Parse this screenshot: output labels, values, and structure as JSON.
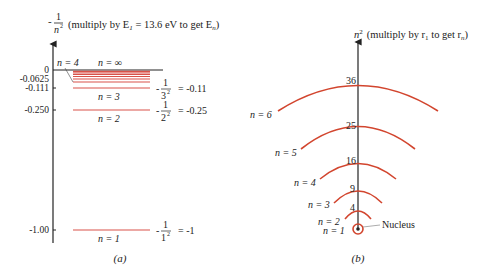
{
  "panel_a": {
    "caption": "(a)",
    "axis_label_prefix": "-",
    "axis_label_num": "1",
    "axis_label_den": "n",
    "axis_label_den_exp": "2",
    "axis_note": "(multiply by E",
    "axis_note_sub": "1",
    "axis_note_rest": " = 13.6 eV to get E",
    "axis_note_sub2": "n",
    "axis_note_end": ")",
    "ticks": [
      {
        "label": "0",
        "value": 0
      },
      {
        "label": "-0.0625",
        "value": -0.0625
      },
      {
        "label": "-0.111",
        "value": -0.111
      },
      {
        "label": "-0.250",
        "value": -0.25
      },
      {
        "label": "-1.00",
        "value": -1.0
      }
    ],
    "levels": [
      {
        "label": "n = 1",
        "value": -1.0,
        "formula_den": "1",
        "formula_result": "= -1"
      },
      {
        "label": "n = 2",
        "value": -0.25,
        "formula_den": "2",
        "formula_result": "= -0.25"
      },
      {
        "label": "n = 3",
        "value": -0.111,
        "formula_den": "3",
        "formula_result": "= -0.11"
      },
      {
        "label": "n = 4",
        "value": -0.0625
      },
      {
        "label": "n = ∞",
        "value": 0
      }
    ],
    "formula_num": "1",
    "formula_exp": "2",
    "formula_prefix": "-"
  },
  "panel_b": {
    "caption": "(b)",
    "axis_label_var": "n",
    "axis_label_exp": "2",
    "axis_note": "(multiply by r",
    "axis_note_sub": "1",
    "axis_note_rest": " to get r",
    "axis_note_sub2": "n",
    "axis_note_end": ")",
    "orbits": [
      {
        "label": "n = 1",
        "radius_value": "1"
      },
      {
        "label": "n = 2",
        "radius_value": "4"
      },
      {
        "label": "n = 3",
        "radius_value": "9"
      },
      {
        "label": "n = 4",
        "radius_value": "16"
      },
      {
        "label": "n = 5",
        "radius_value": "25"
      },
      {
        "label": "n = 6",
        "radius_value": "36"
      }
    ],
    "nucleus_label": "Nucleus"
  },
  "colors": {
    "level_line": "#d9534a",
    "orbit": "#d2452e",
    "axis": "#222222"
  }
}
